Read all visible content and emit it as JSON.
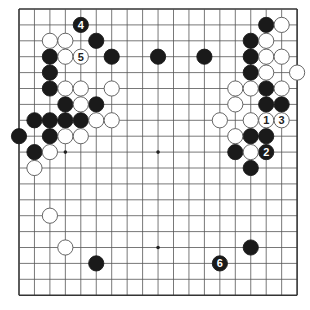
{
  "board": {
    "size": 19,
    "origin_x": 19,
    "origin_y": 9,
    "step_x": 15.45,
    "step_y": 15.9,
    "stone_radius": 7.6,
    "colors": {
      "line": "#555555",
      "edge": "#333333",
      "black_stone": "#1a1a1a",
      "white_stone": "#ffffff",
      "white_stroke": "#555555"
    },
    "star_points": [
      [
        3,
        3
      ],
      [
        9,
        3
      ],
      [
        15,
        3
      ],
      [
        3,
        9
      ],
      [
        9,
        9
      ],
      [
        15,
        9
      ],
      [
        3,
        15
      ],
      [
        9,
        15
      ],
      [
        15,
        15
      ]
    ],
    "black_stones": [
      {
        "x": 4,
        "y": 1,
        "label": "4"
      },
      {
        "x": 5,
        "y": 2
      },
      {
        "x": 6,
        "y": 3
      },
      {
        "x": 9,
        "y": 3
      },
      {
        "x": 12,
        "y": 3
      },
      {
        "x": 2,
        "y": 3
      },
      {
        "x": 2,
        "y": 4
      },
      {
        "x": 2,
        "y": 5
      },
      {
        "x": 3,
        "y": 6
      },
      {
        "x": 5,
        "y": 6
      },
      {
        "x": 1,
        "y": 7
      },
      {
        "x": 2,
        "y": 7
      },
      {
        "x": 3,
        "y": 7
      },
      {
        "x": 4,
        "y": 7
      },
      {
        "x": 0,
        "y": 8
      },
      {
        "x": 2,
        "y": 8
      },
      {
        "x": 1,
        "y": 9
      },
      {
        "x": 16,
        "y": 1
      },
      {
        "x": 15,
        "y": 2
      },
      {
        "x": 15,
        "y": 3
      },
      {
        "x": 15,
        "y": 4
      },
      {
        "x": 16,
        "y": 5
      },
      {
        "x": 16,
        "y": 6
      },
      {
        "x": 17,
        "y": 6
      },
      {
        "x": 15,
        "y": 8
      },
      {
        "x": 16,
        "y": 8
      },
      {
        "x": 14,
        "y": 9
      },
      {
        "x": 16,
        "y": 9,
        "label": "2"
      },
      {
        "x": 15,
        "y": 10
      },
      {
        "x": 5,
        "y": 16
      },
      {
        "x": 15,
        "y": 15
      },
      {
        "x": 13,
        "y": 16,
        "label": "6"
      }
    ],
    "white_stones": [
      {
        "x": 2,
        "y": 2
      },
      {
        "x": 3,
        "y": 2
      },
      {
        "x": 3,
        "y": 3
      },
      {
        "x": 4,
        "y": 3,
        "label": "5"
      },
      {
        "x": 3,
        "y": 5
      },
      {
        "x": 4,
        "y": 5
      },
      {
        "x": 6,
        "y": 5
      },
      {
        "x": 4,
        "y": 6
      },
      {
        "x": 5,
        "y": 7
      },
      {
        "x": 6,
        "y": 7
      },
      {
        "x": 3,
        "y": 8
      },
      {
        "x": 4,
        "y": 8
      },
      {
        "x": 2,
        "y": 9
      },
      {
        "x": 1,
        "y": 10
      },
      {
        "x": 17,
        "y": 1
      },
      {
        "x": 16,
        "y": 2
      },
      {
        "x": 16,
        "y": 3
      },
      {
        "x": 17,
        "y": 3
      },
      {
        "x": 16,
        "y": 4
      },
      {
        "x": 18,
        "y": 4
      },
      {
        "x": 14,
        "y": 5
      },
      {
        "x": 15,
        "y": 5
      },
      {
        "x": 17,
        "y": 5
      },
      {
        "x": 14,
        "y": 6
      },
      {
        "x": 13,
        "y": 7
      },
      {
        "x": 15,
        "y": 7
      },
      {
        "x": 16,
        "y": 7,
        "label": "1"
      },
      {
        "x": 17,
        "y": 7,
        "label": "3"
      },
      {
        "x": 14,
        "y": 8
      },
      {
        "x": 15,
        "y": 9
      },
      {
        "x": 2,
        "y": 13
      },
      {
        "x": 3,
        "y": 15
      }
    ]
  }
}
